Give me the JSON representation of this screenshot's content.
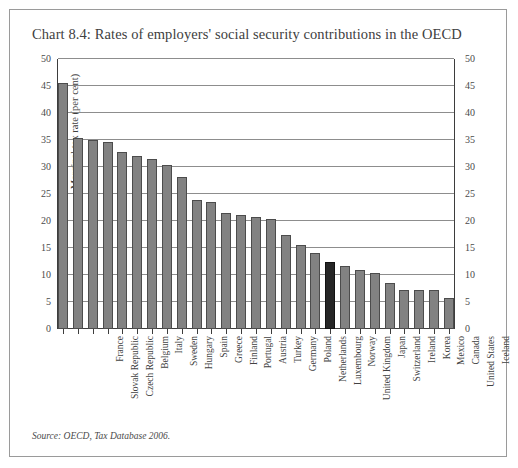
{
  "figure": {
    "title": "Chart 8.4: Rates of employers' social security contributions in the OECD",
    "source": "Source: OECD, Tax Database 2006.",
    "border_color": "#9a9a9a",
    "background": "#ffffff"
  },
  "chart_data": {
    "type": "bar",
    "title": "Chart 8.4: Rates of employers' social security contributions in the OECD",
    "xlabel": "",
    "ylabel": "Marginal tax rate (per cent)",
    "ylim": [
      0,
      50
    ],
    "ytick_step": 5,
    "yticks": [
      0,
      5,
      10,
      15,
      20,
      25,
      30,
      35,
      40,
      45,
      50
    ],
    "ytick_labels_left": [
      "0",
      "5",
      "10",
      "15",
      "20",
      "25",
      "30",
      "35",
      "40",
      "45",
      "50"
    ],
    "ytick_labels_right": [
      "0",
      "5",
      "10",
      "15",
      "20",
      "25",
      "30",
      "35",
      "40",
      "45",
      "50"
    ],
    "grid": true,
    "grid_axis": "y",
    "legend": null,
    "bar_color": "#828282",
    "highlight_color": "#262626",
    "highlight_category": "United Kingdom",
    "categories": [
      "France",
      "Slovak Republic",
      "Czech Republic",
      "Belgium",
      "Italy",
      "Sweden",
      "Hungary",
      "Spain",
      "Greece",
      "Finland",
      "Portugal",
      "Austria",
      "Turkey",
      "Germany",
      "Poland",
      "Netherlands",
      "Luxembourg",
      "Norway",
      "United Kingdom",
      "Japan",
      "Switzerland",
      "Ireland",
      "Korea",
      "Mexico",
      "Canada",
      "United States",
      "Iceland"
    ],
    "values": [
      45.5,
      35.4,
      35.0,
      34.7,
      32.8,
      32.0,
      31.5,
      30.4,
      28.1,
      23.8,
      23.6,
      21.4,
      21.2,
      20.8,
      20.4,
      17.4,
      15.5,
      14.0,
      12.5,
      11.6,
      11.0,
      10.4,
      8.5,
      7.3,
      7.3,
      7.3,
      5.7
    ]
  }
}
